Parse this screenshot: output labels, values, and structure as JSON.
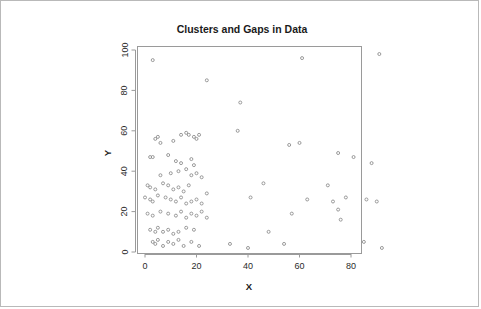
{
  "figure": {
    "title": "Clusters and Gaps in Data",
    "background_color": "#ffffff",
    "border_color": "#b9b9b9",
    "frame_color": "#9a9a9a",
    "point_color": "#8e8e8e"
  },
  "chart_data": {
    "type": "scatter",
    "title": "Clusters and Gaps in Data",
    "xlabel": "X",
    "ylabel": "Y",
    "xlim": [
      -2,
      98
    ],
    "ylim": [
      -4,
      104
    ],
    "xticks": [
      0,
      20,
      40,
      60,
      80
    ],
    "yticks": [
      0,
      20,
      40,
      60,
      80,
      100
    ],
    "xtick_labels": [
      "0",
      "20",
      "40",
      "60",
      "80"
    ],
    "ytick_labels": [
      "0",
      "20",
      "40",
      "60",
      "80",
      "100"
    ],
    "grid": false,
    "legend": null,
    "marker": "open-circle",
    "marker_size": 3,
    "series": [
      {
        "name": "points",
        "points": [
          [
            3,
            95
          ],
          [
            61,
            96
          ],
          [
            24,
            85
          ],
          [
            91,
            98
          ],
          [
            37,
            74
          ],
          [
            4,
            56
          ],
          [
            5,
            57
          ],
          [
            6,
            54
          ],
          [
            11,
            55
          ],
          [
            14,
            58
          ],
          [
            16,
            59
          ],
          [
            17,
            58
          ],
          [
            19,
            57
          ],
          [
            20,
            56
          ],
          [
            21,
            58
          ],
          [
            36,
            60
          ],
          [
            56,
            53
          ],
          [
            60,
            54
          ],
          [
            2,
            47
          ],
          [
            3,
            47
          ],
          [
            9,
            48
          ],
          [
            12,
            45
          ],
          [
            14,
            44
          ],
          [
            18,
            46
          ],
          [
            19,
            43
          ],
          [
            75,
            49
          ],
          [
            81,
            47
          ],
          [
            88,
            44
          ],
          [
            6,
            38
          ],
          [
            10,
            39
          ],
          [
            13,
            40
          ],
          [
            16,
            41
          ],
          [
            18,
            38
          ],
          [
            20,
            39
          ],
          [
            22,
            37
          ],
          [
            1,
            33
          ],
          [
            2,
            32
          ],
          [
            4,
            31
          ],
          [
            7,
            34
          ],
          [
            9,
            33
          ],
          [
            11,
            31
          ],
          [
            13,
            32
          ],
          [
            15,
            30
          ],
          [
            17,
            33
          ],
          [
            46,
            34
          ],
          [
            71,
            33
          ],
          [
            0,
            27
          ],
          [
            2,
            26
          ],
          [
            3,
            25
          ],
          [
            5,
            28
          ],
          [
            8,
            27
          ],
          [
            10,
            26
          ],
          [
            12,
            25
          ],
          [
            14,
            27
          ],
          [
            16,
            24
          ],
          [
            18,
            25
          ],
          [
            20,
            26
          ],
          [
            22,
            24
          ],
          [
            24,
            29
          ],
          [
            41,
            27
          ],
          [
            63,
            26
          ],
          [
            73,
            25
          ],
          [
            78,
            27
          ],
          [
            86,
            26
          ],
          [
            90,
            25
          ],
          [
            1,
            19
          ],
          [
            3,
            18
          ],
          [
            6,
            20
          ],
          [
            9,
            19
          ],
          [
            12,
            18
          ],
          [
            14,
            20
          ],
          [
            16,
            17
          ],
          [
            18,
            19
          ],
          [
            20,
            18
          ],
          [
            22,
            20
          ],
          [
            24,
            17
          ],
          [
            57,
            19
          ],
          [
            75,
            21
          ],
          [
            76,
            16
          ],
          [
            2,
            11
          ],
          [
            4,
            10
          ],
          [
            5,
            12
          ],
          [
            7,
            10
          ],
          [
            9,
            11
          ],
          [
            11,
            9
          ],
          [
            13,
            10
          ],
          [
            16,
            12
          ],
          [
            19,
            11
          ],
          [
            48,
            10
          ],
          [
            3,
            5
          ],
          [
            4,
            4
          ],
          [
            5,
            6
          ],
          [
            7,
            3
          ],
          [
            9,
            5
          ],
          [
            11,
            4
          ],
          [
            13,
            6
          ],
          [
            15,
            3
          ],
          [
            18,
            5
          ],
          [
            21,
            3
          ],
          [
            33,
            4
          ],
          [
            40,
            2
          ],
          [
            54,
            4
          ],
          [
            85,
            5
          ],
          [
            92,
            2
          ]
        ]
      }
    ]
  }
}
